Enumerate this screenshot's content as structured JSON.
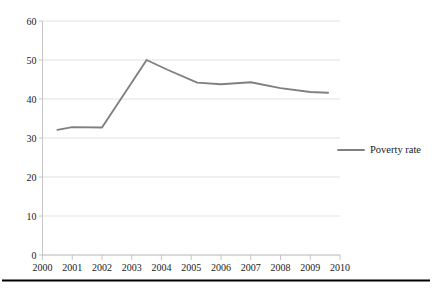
{
  "chart_data": {
    "type": "line",
    "title": "",
    "subtitle": "",
    "xlabel": "",
    "ylabel": "",
    "xlim": [
      2000,
      2010
    ],
    "ylim": [
      0,
      60
    ],
    "grid": true,
    "grid_axis": "y",
    "legend_position": "right",
    "x_tick_labels": [
      "2000",
      "2001",
      "2002",
      "2003",
      "2004",
      "2005",
      "2006",
      "2007",
      "2008",
      "2009",
      "2010"
    ],
    "y_tick_labels": [
      "0",
      "10",
      "20",
      "30",
      "40",
      "50",
      "60"
    ],
    "y_ticks": [
      0,
      10,
      20,
      30,
      40,
      50,
      60
    ],
    "series": [
      {
        "name": "Poverty rate",
        "color": "#808080",
        "x": [
          2000.5,
          2001.0,
          2002.0,
          2003.5,
          2004.2,
          2005.2,
          2006.0,
          2007.0,
          2008.0,
          2009.0,
          2009.6
        ],
        "values": [
          32.1,
          32.8,
          32.7,
          50.0,
          47.5,
          44.2,
          43.8,
          44.3,
          42.8,
          41.8,
          41.6
        ]
      }
    ],
    "legend": [
      {
        "label": "Poverty rate",
        "color": "#808080"
      }
    ]
  },
  "colors": {
    "line": "#808080",
    "grid": "#d9d9d9",
    "axis": "#bfbfbf",
    "text": "#1a1a1a",
    "rule": "#000000",
    "background": "#ffffff"
  }
}
